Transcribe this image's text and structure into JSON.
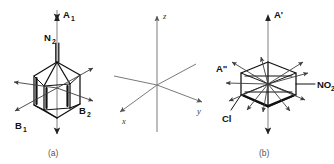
{
  "figure": {
    "background_color": "#ffffff",
    "line_color": "#111111",
    "vector_color": "#3d3d3d",
    "axis_color": "#8a8a8a"
  },
  "panel_a": {
    "caption": "(a)",
    "molecule_name": "diazo bicyclic cage",
    "substituent_label": "N",
    "substituent_sub": "2",
    "vectors": [
      {
        "label": "A",
        "sub": "1",
        "direction": "up"
      },
      {
        "label": "B",
        "sub": "1",
        "direction": "lower-left"
      },
      {
        "label": "B",
        "sub": "2",
        "direction": "right"
      }
    ]
  },
  "panel_axes": {
    "z_label": "z",
    "y_label": "y",
    "x_label": "x"
  },
  "panel_b": {
    "caption": "(b)",
    "molecule_name": "chloronitrobenzene ring",
    "substituents": [
      {
        "label": "Cl",
        "sub": "",
        "position": "lower-left"
      },
      {
        "label": "NO",
        "sub": "2",
        "position": "right"
      }
    ],
    "vectors": [
      {
        "label": "A'",
        "sub": "",
        "direction": "up"
      },
      {
        "label": "A\"",
        "sub": "",
        "direction": "left"
      }
    ]
  }
}
